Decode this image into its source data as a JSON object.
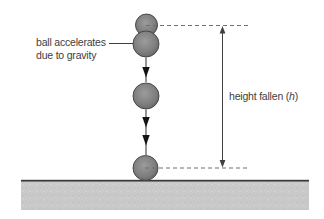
{
  "figure": {
    "labels": {
      "acceleration_line1": "ball accelerates",
      "acceleration_line2": "due to gravity",
      "height_prefix": "height fallen (",
      "height_variable": "h",
      "height_suffix": ")"
    },
    "colors": {
      "background": "#ffffff",
      "ball_highlight": "#9c9c9c",
      "ball_shadow": "#525252",
      "ball_outline": "#3f3f3f",
      "line": "#3f3f3f",
      "dashed_line": "#6e6e6e",
      "text": "#3e3e3e",
      "ground_fill": "#c9c9c9",
      "ground_edge": "#383838"
    }
  }
}
